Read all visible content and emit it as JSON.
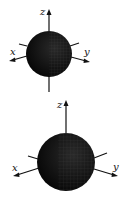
{
  "figures": [
    {
      "id": "sphere-small",
      "axes": {
        "x_label": "x",
        "y_label": "y",
        "z_label": "z"
      },
      "sphere": {
        "cx": 49,
        "cy": 54,
        "r": 23,
        "fill": "#0d0d0d",
        "mesh": "#3a3a3a"
      },
      "z_axis": {
        "x": 49,
        "top": 10,
        "bottom": 92
      },
      "x_axis": {
        "from": [
          28,
          50
        ],
        "to": [
          10,
          60
        ]
      },
      "y_axis": {
        "from": [
          68,
          56
        ],
        "to": [
          88,
          62
        ]
      }
    },
    {
      "id": "sphere-large",
      "axes": {
        "x_label": "x",
        "y_label": "y",
        "z_label": "z"
      },
      "sphere": {
        "cx": 66,
        "cy": 64,
        "r": 29,
        "fill": "#0d0d0d",
        "mesh": "#3a3a3a"
      },
      "z_axis": {
        "x": 66,
        "top": 2,
        "bottom": 36
      },
      "x_axis": {
        "from": [
          40,
          68
        ],
        "to": [
          14,
          78
        ]
      },
      "y_axis": {
        "from": [
          92,
          68
        ],
        "to": [
          118,
          78
        ]
      }
    }
  ],
  "colors": {
    "ink": "#111111",
    "background": "#ffffff"
  }
}
